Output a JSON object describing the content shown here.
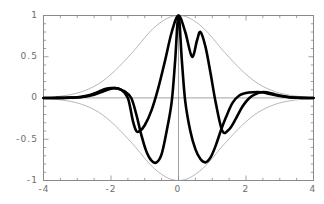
{
  "figure": {
    "background_color": "#ffffff",
    "frame_color": "#808080",
    "tick_color": "#808080",
    "label_color": "#6d6d6d",
    "curve_thick_color": "#000000",
    "curve_thin_color": "#9a9a9a"
  },
  "chart_data": {
    "type": "line",
    "title": "",
    "xlabel": "",
    "ylabel": "",
    "xlim": [
      -4,
      4
    ],
    "ylim": [
      -1,
      1
    ],
    "grid": false,
    "legend": null,
    "frame": true,
    "xticks": [
      -4,
      -2,
      0,
      2,
      4
    ],
    "xtick_labels": [
      "-4",
      "-2",
      "0",
      "2",
      "4"
    ],
    "yticks": [
      -1,
      -0.5,
      0,
      0.5,
      1
    ],
    "ytick_labels": [
      "-1",
      "-0.5",
      "0",
      "0.5",
      "1"
    ],
    "minor_xticks": [
      -3.5,
      -3,
      -2.5,
      -1.5,
      -1,
      -0.5,
      0.5,
      1,
      1.5,
      2.5,
      3,
      3.5
    ],
    "minor_yticks": [
      -0.9,
      -0.8,
      -0.7,
      -0.6,
      -0.4,
      -0.3,
      -0.2,
      -0.1,
      0.1,
      0.2,
      0.3,
      0.4,
      0.6,
      0.7,
      0.8,
      0.9
    ],
    "series": [
      {
        "name": "gaussian-envelope",
        "style": "thin",
        "color": "#9a9a9a",
        "linewidth": 0.7,
        "formula": "exp(-x^2/3.2)",
        "x": [
          -4,
          -3.75,
          -3.5,
          -3.25,
          -3,
          -2.75,
          -2.5,
          -2.25,
          -2,
          -1.75,
          -1.5,
          -1.25,
          -1,
          -0.75,
          -0.5,
          -0.25,
          0,
          0.25,
          0.5,
          0.75,
          1,
          1.25,
          1.5,
          1.75,
          2,
          2.25,
          2.5,
          2.75,
          3,
          3.25,
          3.5,
          3.75,
          4
        ],
        "values": [
          0.007,
          0.013,
          0.022,
          0.037,
          0.06,
          0.094,
          0.141,
          0.204,
          0.287,
          0.385,
          0.494,
          0.606,
          0.732,
          0.843,
          0.925,
          0.981,
          1.0,
          0.981,
          0.925,
          0.843,
          0.732,
          0.606,
          0.494,
          0.385,
          0.287,
          0.204,
          0.141,
          0.094,
          0.06,
          0.037,
          0.022,
          0.013,
          0.007
        ]
      },
      {
        "name": "gaussian-envelope-negative",
        "style": "thin",
        "color": "#9a9a9a",
        "linewidth": 0.7,
        "formula": "-exp(-x^2/3.2)",
        "x": [
          -4,
          -3.75,
          -3.5,
          -3.25,
          -3,
          -2.75,
          -2.5,
          -2.25,
          -2,
          -1.75,
          -1.5,
          -1.25,
          -1,
          -0.75,
          -0.5,
          -0.25,
          0,
          0.25,
          0.5,
          0.75,
          1,
          1.25,
          1.5,
          1.75,
          2,
          2.25,
          2.5,
          2.75,
          3,
          3.25,
          3.5,
          3.75,
          4
        ],
        "values": [
          -0.007,
          -0.013,
          -0.022,
          -0.037,
          -0.06,
          -0.094,
          -0.141,
          -0.204,
          -0.287,
          -0.385,
          -0.494,
          -0.606,
          -0.732,
          -0.843,
          -0.925,
          -0.981,
          -1.0,
          -0.981,
          -0.925,
          -0.843,
          -0.732,
          -0.606,
          -0.494,
          -0.385,
          -0.287,
          -0.204,
          -0.141,
          -0.094,
          -0.06,
          -0.037,
          -0.022,
          -0.013,
          -0.007
        ]
      },
      {
        "name": "wave-packet-a",
        "style": "thick",
        "color": "#000000",
        "linewidth": 2.6,
        "peaks": [
          {
            "x": 0.0,
            "y": 1.0
          },
          {
            "x": -1.9,
            "y": 0.12
          },
          {
            "x": 2.45,
            "y": 0.07
          }
        ],
        "troughs": [
          {
            "x": -0.65,
            "y": -0.78
          },
          {
            "x": 1.25,
            "y": -0.4
          }
        ],
        "x": [
          -4,
          -3.8,
          -3.6,
          -3.4,
          -3.2,
          -3,
          -2.8,
          -2.6,
          -2.4,
          -2.2,
          -2,
          -1.9,
          -1.8,
          -1.6,
          -1.4,
          -1.25,
          -1.1,
          -0.95,
          -0.8,
          -0.65,
          -0.5,
          -0.35,
          -0.2,
          -0.1,
          0,
          0.1,
          0.2,
          0.35,
          0.5,
          0.65,
          0.8,
          0.95,
          1.1,
          1.25,
          1.4,
          1.6,
          1.8,
          2,
          2.2,
          2.45,
          2.7,
          3,
          3.3,
          3.6,
          4
        ],
        "values": [
          0.0,
          0.0,
          0.001,
          0.002,
          0.004,
          0.009,
          0.02,
          0.04,
          0.07,
          0.105,
          0.12,
          0.12,
          0.115,
          0.08,
          0.0,
          -0.2,
          -0.45,
          -0.65,
          -0.76,
          -0.78,
          -0.68,
          -0.4,
          -0.04,
          0.45,
          1.0,
          0.45,
          -0.04,
          -0.4,
          -0.62,
          -0.74,
          -0.78,
          -0.72,
          -0.58,
          -0.4,
          -0.24,
          -0.06,
          0.03,
          0.06,
          0.07,
          0.07,
          0.05,
          0.025,
          0.008,
          0.002,
          0.0
        ]
      },
      {
        "name": "wave-packet-b",
        "style": "thick",
        "color": "#000000",
        "linewidth": 2.6,
        "peaks": [
          {
            "x": 0.0,
            "y": 1.0
          },
          {
            "x": 0.65,
            "y": 0.8
          },
          {
            "x": -1.9,
            "y": 0.12
          }
        ],
        "troughs": [
          {
            "x": -1.25,
            "y": -0.4
          },
          {
            "x": 1.3,
            "y": -0.4
          }
        ],
        "x": [
          -4,
          -3.6,
          -3.2,
          -2.9,
          -2.6,
          -2.3,
          -2.1,
          -1.9,
          -1.7,
          -1.5,
          -1.35,
          -1.25,
          -1.15,
          -1.0,
          -0.8,
          -0.6,
          -0.4,
          -0.2,
          0,
          0.2,
          0.4,
          0.55,
          0.65,
          0.8,
          0.95,
          1.1,
          1.3,
          1.5,
          1.7,
          1.9,
          2.1,
          2.3,
          2.45,
          2.6,
          2.8,
          3,
          3.3,
          3.6,
          4
        ],
        "values": [
          0.0,
          0.001,
          0.004,
          0.01,
          0.03,
          0.07,
          0.1,
          0.12,
          0.1,
          0.0,
          -0.28,
          -0.4,
          -0.4,
          -0.33,
          -0.15,
          0.12,
          0.45,
          0.8,
          1.0,
          0.8,
          0.5,
          0.7,
          0.8,
          0.62,
          0.3,
          -0.05,
          -0.4,
          -0.38,
          -0.25,
          -0.1,
          0.0,
          0.05,
          0.07,
          0.07,
          0.05,
          0.03,
          0.01,
          0.003,
          0.0
        ]
      }
    ]
  }
}
